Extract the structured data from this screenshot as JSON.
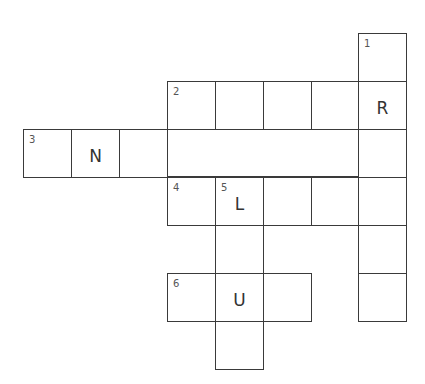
{
  "puzzle": {
    "cells": [
      {
        "col": 7,
        "row": 0,
        "num": "1",
        "letter": ""
      },
      {
        "col": 3,
        "row": 1,
        "num": "2",
        "letter": ""
      },
      {
        "col": 4,
        "row": 1,
        "num": "",
        "letter": ""
      },
      {
        "col": 5,
        "row": 1,
        "num": "",
        "letter": ""
      },
      {
        "col": 6,
        "row": 1,
        "num": "",
        "letter": ""
      },
      {
        "col": 7,
        "row": 1,
        "num": "",
        "letter": "R"
      },
      {
        "col": 0,
        "row": 2,
        "num": "3",
        "letter": ""
      },
      {
        "col": 1,
        "row": 2,
        "num": "",
        "letter": "N"
      },
      {
        "col": 2,
        "row": 2,
        "num": "",
        "letter": ""
      },
      {
        "col": 7,
        "row": 2,
        "num": "",
        "letter": ""
      },
      {
        "col": 3,
        "row": 3,
        "num": "4",
        "letter": ""
      },
      {
        "col": 4,
        "row": 3,
        "num": "5",
        "letter": "L"
      },
      {
        "col": 5,
        "row": 3,
        "num": "",
        "letter": ""
      },
      {
        "col": 6,
        "row": 3,
        "num": "",
        "letter": ""
      },
      {
        "col": 7,
        "row": 3,
        "num": "",
        "letter": ""
      },
      {
        "col": 4,
        "row": 4,
        "num": "",
        "letter": ""
      },
      {
        "col": 7,
        "row": 4,
        "num": "",
        "letter": ""
      },
      {
        "col": 3,
        "row": 5,
        "num": "6",
        "letter": ""
      },
      {
        "col": 4,
        "row": 5,
        "num": "",
        "letter": "U"
      },
      {
        "col": 5,
        "row": 5,
        "num": "",
        "letter": ""
      },
      {
        "col": 7,
        "row": 5,
        "num": "",
        "letter": ""
      },
      {
        "col": 4,
        "row": 6,
        "num": "",
        "letter": ""
      }
    ]
  }
}
